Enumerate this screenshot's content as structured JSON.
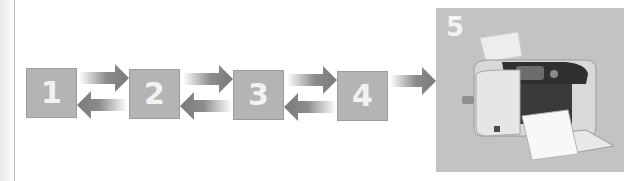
{
  "diagram": {
    "steps": [
      {
        "label": "1"
      },
      {
        "label": "2"
      },
      {
        "label": "3"
      },
      {
        "label": "4"
      },
      {
        "label": "5",
        "image": "photo-printer"
      }
    ],
    "colors": {
      "box_fill": "#b4b4b4",
      "arrow": "#7a7a7a",
      "label": "#f2f2f2",
      "panel": "#c3c3c3"
    }
  }
}
